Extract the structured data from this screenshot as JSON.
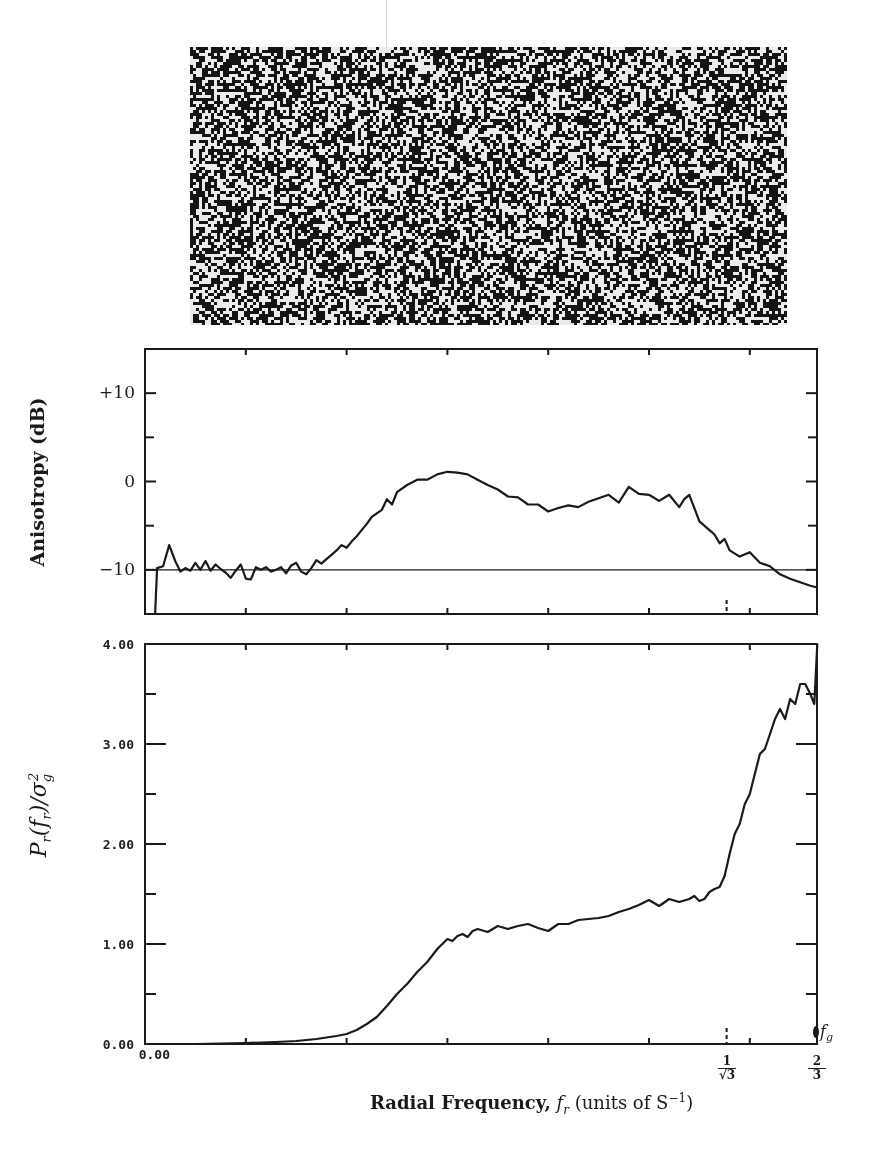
{
  "chart_data": [
    {
      "type": "image",
      "title": "",
      "description": "Binary halftone dither pattern (blue-noise texture) above plots"
    },
    {
      "type": "line",
      "title": "",
      "xlabel": "Radial Frequency, f_r (units of S^-1)",
      "ylabel": "Anisotropy (dB)",
      "xlim": [
        0,
        0.6667
      ],
      "ylim": [
        -15,
        15
      ],
      "yticks": [
        -10,
        0,
        10
      ],
      "ytick_labels": [
        "−10",
        "0",
        "+10"
      ],
      "reference_line": -10,
      "special_xticks": [
        {
          "x": 0.577,
          "label": "1/√3",
          "style": "dashed"
        }
      ],
      "grid": false,
      "series": [
        {
          "name": "anisotropy",
          "x": [
            0.01,
            0.012,
            0.018,
            0.024,
            0.03,
            0.035,
            0.04,
            0.045,
            0.05,
            0.055,
            0.06,
            0.065,
            0.07,
            0.075,
            0.08,
            0.085,
            0.09,
            0.095,
            0.1,
            0.105,
            0.11,
            0.115,
            0.12,
            0.125,
            0.13,
            0.135,
            0.14,
            0.145,
            0.15,
            0.155,
            0.16,
            0.165,
            0.17,
            0.175,
            0.18,
            0.185,
            0.19,
            0.195,
            0.2,
            0.205,
            0.21,
            0.215,
            0.22,
            0.225,
            0.23,
            0.235,
            0.24,
            0.245,
            0.25,
            0.26,
            0.27,
            0.28,
            0.29,
            0.3,
            0.31,
            0.32,
            0.33,
            0.34,
            0.35,
            0.36,
            0.37,
            0.38,
            0.39,
            0.4,
            0.41,
            0.42,
            0.43,
            0.44,
            0.45,
            0.46,
            0.47,
            0.48,
            0.49,
            0.5,
            0.51,
            0.52,
            0.53,
            0.535,
            0.54,
            0.55,
            0.56,
            0.565,
            0.57,
            0.575,
            0.58,
            0.59,
            0.6,
            0.61,
            0.62,
            0.63,
            0.64,
            0.65,
            0.66,
            0.667
          ],
          "y": [
            -15,
            -9.8,
            -9.6,
            -7.2,
            -9.0,
            -10.2,
            -9.8,
            -10.1,
            -9.2,
            -10.0,
            -9.0,
            -10.1,
            -9.4,
            -9.9,
            -10.3,
            -10.9,
            -10.1,
            -9.4,
            -11.0,
            -11.1,
            -9.7,
            -10.0,
            -9.7,
            -10.2,
            -10.0,
            -9.7,
            -10.4,
            -9.5,
            -9.2,
            -10.2,
            -10.5,
            -9.8,
            -8.9,
            -9.3,
            -8.8,
            -8.3,
            -7.8,
            -7.2,
            -7.5,
            -6.8,
            -6.2,
            -5.5,
            -4.8,
            -4.0,
            -3.6,
            -3.2,
            -2.0,
            -2.6,
            -1.2,
            -0.4,
            0.2,
            0.2,
            0.8,
            1.1,
            1.0,
            0.8,
            0.2,
            -0.4,
            -0.9,
            -1.7,
            -1.8,
            -2.6,
            -2.6,
            -3.4,
            -3.0,
            -2.7,
            -2.9,
            -2.3,
            -1.9,
            -1.5,
            -2.4,
            -0.6,
            -1.4,
            -1.5,
            -2.2,
            -1.5,
            -2.9,
            -2.0,
            -1.5,
            -4.5,
            -5.5,
            -6.0,
            -7.0,
            -6.5,
            -7.8,
            -8.5,
            -8.0,
            -9.2,
            -9.6,
            -10.5,
            -11.0,
            -11.4,
            -11.8,
            -12.0
          ]
        }
      ]
    },
    {
      "type": "line",
      "title": "",
      "xlabel": "Radial Frequency, f_r (units of S^-1)",
      "ylabel": "P_r(f_r)/σ_g²",
      "xlim": [
        0,
        0.6667
      ],
      "ylim": [
        0,
        4
      ],
      "yticks": [
        0,
        1,
        2,
        3,
        4
      ],
      "ytick_labels": [
        "0.00",
        "1.00",
        "2.00",
        "3.00",
        "4.00"
      ],
      "xtick_labels": [
        {
          "x": 0,
          "label": "0.00"
        },
        {
          "x": 0.577,
          "label": "1/√3"
        },
        {
          "x": 0.6667,
          "label": "2/3"
        }
      ],
      "special_xticks": [
        {
          "x": 0.577,
          "label": "1/√3",
          "style": "dashed"
        }
      ],
      "annotations": [
        {
          "x": 0.6667,
          "y": 0.0,
          "text": "f_g"
        }
      ],
      "grid": false,
      "series": [
        {
          "name": "radially averaged power spectrum",
          "x": [
            0.0,
            0.05,
            0.1,
            0.13,
            0.15,
            0.17,
            0.19,
            0.2,
            0.21,
            0.22,
            0.23,
            0.24,
            0.25,
            0.26,
            0.27,
            0.28,
            0.29,
            0.3,
            0.305,
            0.31,
            0.315,
            0.32,
            0.325,
            0.33,
            0.34,
            0.35,
            0.36,
            0.37,
            0.38,
            0.39,
            0.4,
            0.41,
            0.42,
            0.43,
            0.44,
            0.45,
            0.46,
            0.47,
            0.48,
            0.49,
            0.5,
            0.51,
            0.52,
            0.53,
            0.54,
            0.545,
            0.55,
            0.555,
            0.56,
            0.565,
            0.57,
            0.575,
            0.58,
            0.585,
            0.59,
            0.595,
            0.6,
            0.605,
            0.61,
            0.615,
            0.62,
            0.625,
            0.63,
            0.635,
            0.64,
            0.645,
            0.65,
            0.655,
            0.66,
            0.664,
            0.667
          ],
          "y": [
            0.0,
            0.0,
            0.01,
            0.02,
            0.03,
            0.05,
            0.08,
            0.1,
            0.14,
            0.2,
            0.27,
            0.38,
            0.5,
            0.6,
            0.72,
            0.82,
            0.95,
            1.05,
            1.03,
            1.08,
            1.1,
            1.07,
            1.13,
            1.15,
            1.12,
            1.18,
            1.15,
            1.18,
            1.2,
            1.16,
            1.13,
            1.2,
            1.2,
            1.24,
            1.25,
            1.26,
            1.28,
            1.32,
            1.35,
            1.39,
            1.44,
            1.38,
            1.45,
            1.42,
            1.45,
            1.48,
            1.43,
            1.45,
            1.52,
            1.55,
            1.57,
            1.68,
            1.9,
            2.1,
            2.2,
            2.4,
            2.5,
            2.7,
            2.9,
            2.95,
            3.1,
            3.25,
            3.35,
            3.25,
            3.45,
            3.4,
            3.6,
            3.6,
            3.5,
            3.4,
            4.0
          ]
        }
      ]
    }
  ],
  "top_chart": {
    "ylabel": "Anisotropy (dB)",
    "ytick_plus10": "+10",
    "ytick_0": "0",
    "ytick_minus10": "−10"
  },
  "bottom_chart": {
    "ylabel": "Pr(fr)/σg²",
    "ytick_4": "4.00",
    "ytick_3": "3.00",
    "ytick_2": "2.00",
    "ytick_1": "1.00",
    "ytick_0": "0.00",
    "xtick_0": "0.00",
    "frac1_num": "1",
    "frac1_den": "√3",
    "frac2_num": "2",
    "frac2_den": "3",
    "fg_label": "f",
    "fg_sub": "g"
  },
  "xaxis": {
    "label_bold": "Radial Frequency,",
    "label_var": "f",
    "label_var_sub": "r",
    "label_units": "(units of S",
    "label_units_sup": "−1",
    "label_close": ")"
  }
}
